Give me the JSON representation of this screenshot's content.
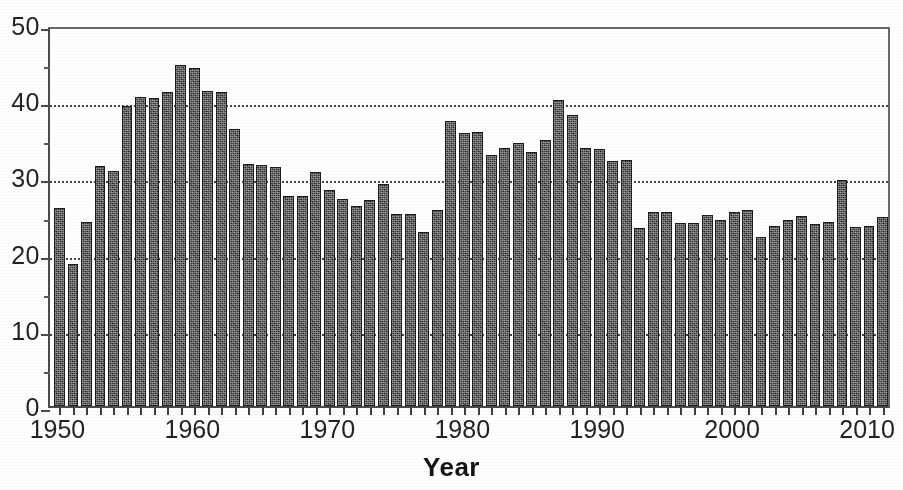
{
  "chart_data": {
    "type": "bar",
    "title": "",
    "subtitle": "",
    "xlabel": "Year",
    "ylabel": "",
    "xlim": [
      1949.3,
      2011.7
    ],
    "ylim": [
      0,
      50
    ],
    "grid": "horizontal dotted gridlines at 10, 20, 30, 40",
    "legend": "none",
    "y_ticks": [
      0,
      10,
      20,
      30,
      40,
      50
    ],
    "y_minor_ticks": [
      5,
      15,
      25,
      35,
      45
    ],
    "x_ticks": [
      1950,
      1960,
      1970,
      1980,
      1990,
      2000,
      2010
    ],
    "x_tick_labels": [
      "1950",
      "1960",
      "1970",
      "1980",
      "1990",
      "2000",
      "2010"
    ],
    "bar_color": "#2f2f2f",
    "categories": [
      1950,
      1951,
      1952,
      1953,
      1954,
      1955,
      1956,
      1957,
      1958,
      1959,
      1960,
      1961,
      1962,
      1963,
      1964,
      1965,
      1966,
      1967,
      1968,
      1969,
      1970,
      1971,
      1972,
      1973,
      1974,
      1975,
      1976,
      1977,
      1978,
      1979,
      1980,
      1981,
      1982,
      1983,
      1984,
      1985,
      1986,
      1987,
      1988,
      1989,
      1990,
      1991,
      1992,
      1993,
      1994,
      1995,
      1996,
      1997,
      1998,
      1999,
      2000,
      2001,
      2002,
      2003,
      2004,
      2005,
      2006,
      2007,
      2008,
      2009,
      2010,
      2011
    ],
    "values": [
      26.0,
      18.6,
      24.1,
      31.5,
      30.9,
      39.4,
      40.6,
      40.4,
      41.2,
      44.8,
      44.3,
      41.3,
      41.2,
      36.3,
      31.8,
      31.6,
      31.4,
      27.5,
      27.5,
      30.7,
      28.3,
      27.2,
      26.3,
      27.1,
      29.2,
      25.2,
      25.2,
      22.8,
      25.7,
      37.4,
      35.8,
      35.9,
      33.0,
      33.8,
      34.5,
      33.3,
      34.9,
      40.2,
      38.2,
      33.8,
      33.7,
      32.2,
      32.3,
      23.4,
      25.5,
      25.4,
      24.0,
      24.0,
      25.1,
      24.4,
      25.5,
      25.7,
      22.2,
      23.6,
      24.4,
      25.0,
      23.9,
      24.2,
      29.7,
      23.5,
      23.6,
      24.8
    ]
  },
  "axis": {
    "x_title": "Year"
  }
}
